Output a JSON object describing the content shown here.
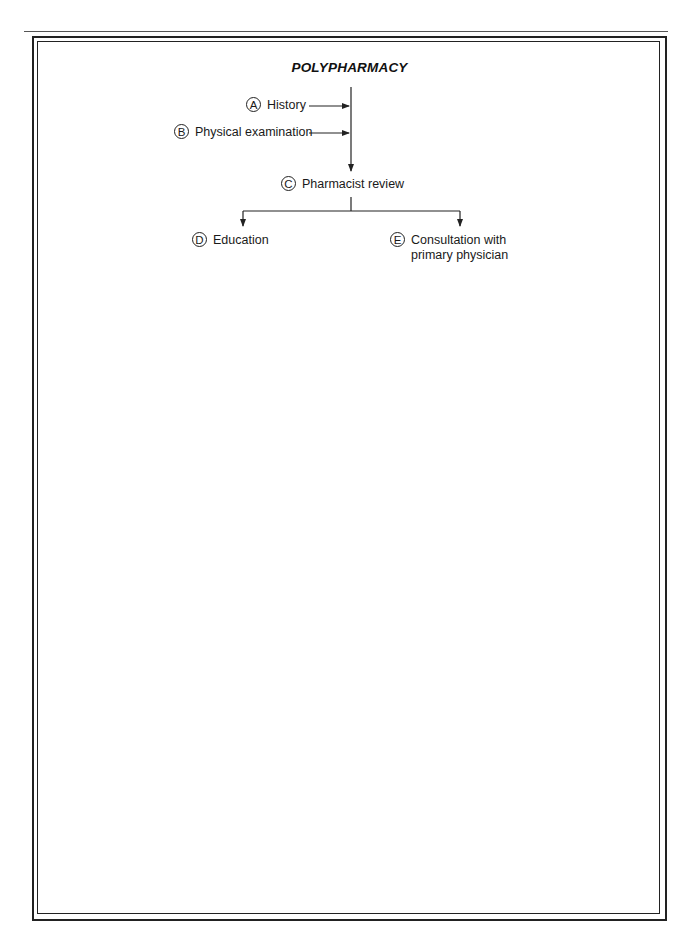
{
  "diagram": {
    "title": "POLYPHARMACY",
    "nodes": [
      {
        "id": "A",
        "badge": "A",
        "label": "History"
      },
      {
        "id": "B",
        "badge": "B",
        "label": "Physical examination"
      },
      {
        "id": "C",
        "badge": "C",
        "label": "Pharmacist review"
      },
      {
        "id": "D",
        "badge": "D",
        "label": "Education"
      },
      {
        "id": "E",
        "badge": "E",
        "label_line1": "Consultation with",
        "label_line2": "primary physician"
      }
    ],
    "edges": [
      {
        "from": "A",
        "to": "C",
        "style": "arrow-into-trunk"
      },
      {
        "from": "B",
        "to": "C",
        "style": "arrow-into-trunk"
      },
      {
        "from": "C",
        "to": "D",
        "style": "branch-arrow"
      },
      {
        "from": "C",
        "to": "E",
        "style": "branch-arrow"
      }
    ],
    "colors": {
      "line": "#222222",
      "text": "#1a1a1a",
      "background": "#ffffff"
    }
  }
}
